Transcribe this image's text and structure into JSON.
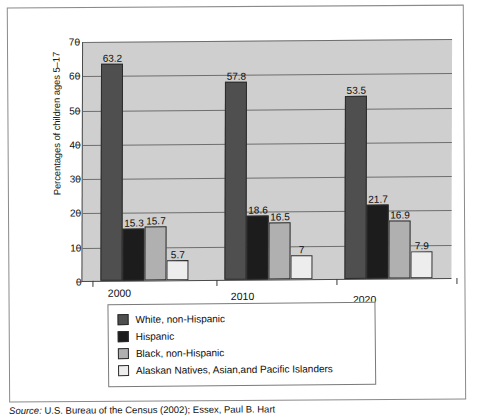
{
  "chart_data": {
    "type": "bar",
    "title": "",
    "xlabel": "",
    "ylabel": "Percentages of children ages 5–17",
    "ylim": [
      0,
      70
    ],
    "ytick_step": 10,
    "yticks": [
      70,
      60,
      50,
      40,
      30,
      20,
      10,
      0
    ],
    "grid": true,
    "legend_position": "bottom",
    "categories": [
      "2000",
      "2010",
      "2020"
    ],
    "series": [
      {
        "name": "White, non-Hispanic",
        "color": "#4f4f4f",
        "values": [
          63.2,
          57.8,
          53.5
        ],
        "labels": [
          "63.2",
          "57.8",
          "53.5"
        ]
      },
      {
        "name": "Hispanic",
        "color": "#1c1c1c",
        "values": [
          15.3,
          18.6,
          21.7
        ],
        "labels": [
          "15.3",
          "18.6",
          "21.7"
        ]
      },
      {
        "name": "Black, non-Hispanic",
        "color": "#b0b0b0",
        "values": [
          15.7,
          16.5,
          16.9
        ],
        "labels": [
          "15.7",
          "16.5",
          "16.9"
        ]
      },
      {
        "name": "Alaskan Natives, Asian,and Pacific Islanders",
        "color": "#ededed",
        "values": [
          5.7,
          7,
          7.9
        ],
        "labels": [
          "5.7",
          "7",
          "7.9"
        ]
      }
    ],
    "plot_background": "#cfcfcf",
    "gridline_color": "#6e6e6e"
  },
  "source": {
    "prefix": "Source:",
    "text": " U.S. Bureau of the Census (2002); Essex, Paul B. Hart"
  }
}
